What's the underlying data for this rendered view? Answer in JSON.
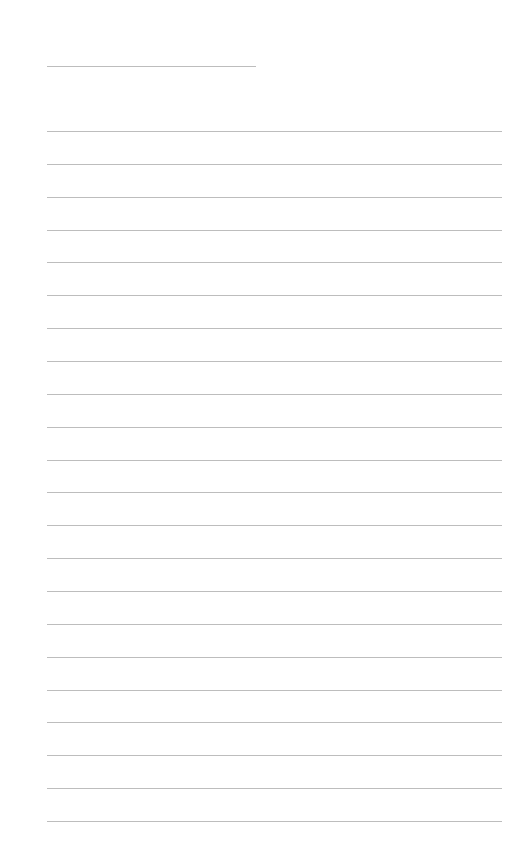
{
  "page": {
    "type": "lined-paper",
    "background": "#ffffff",
    "line_color": "#bdbdbd",
    "title_line": {
      "x": 47,
      "y": 66,
      "width": 209
    },
    "rules": {
      "x": 47,
      "width": 455,
      "count": 22,
      "first_y": 131,
      "spacing": 32.86
    }
  }
}
